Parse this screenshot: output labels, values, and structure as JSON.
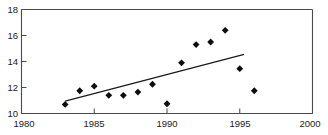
{
  "chart_data": {
    "type": "scatter",
    "title": "",
    "xlabel": "",
    "ylabel": "",
    "xlim": [
      1980,
      2000
    ],
    "ylim": [
      10,
      18
    ],
    "grid": false,
    "legend": null,
    "xticks": [
      1980,
      1985,
      1990,
      1995,
      2000
    ],
    "yticks": [
      10,
      12,
      14,
      16,
      18
    ],
    "xtick_labels": [
      "1980",
      "1985",
      "1990",
      "1995",
      "2000"
    ],
    "ytick_labels": [
      "10",
      "12",
      "14",
      "16",
      "18"
    ],
    "x": [
      1983,
      1984,
      1985,
      1986,
      1987,
      1988,
      1989,
      1990,
      1991,
      1992,
      1993,
      1994,
      1995,
      1996
    ],
    "values": [
      10.7,
      11.75,
      12.1,
      11.4,
      11.4,
      11.65,
      12.25,
      10.75,
      13.9,
      15.3,
      15.5,
      16.4,
      13.45,
      11.75
    ],
    "series": [
      {
        "name": "data points",
        "marker": "diamond",
        "color": "#0d0d0d",
        "values": [
          10.7,
          11.75,
          12.1,
          11.4,
          11.4,
          11.65,
          12.25,
          10.75,
          13.9,
          15.3,
          15.5,
          16.4,
          13.45,
          11.75
        ]
      },
      {
        "name": "trend line",
        "type": "line",
        "color": "#1a1a1a",
        "x": [
          1983,
          1995.3
        ],
        "values": [
          10.95,
          14.55
        ]
      }
    ]
  },
  "axes": {
    "y_axis_name": "y-axis",
    "x_axis_name": "x-axis"
  }
}
